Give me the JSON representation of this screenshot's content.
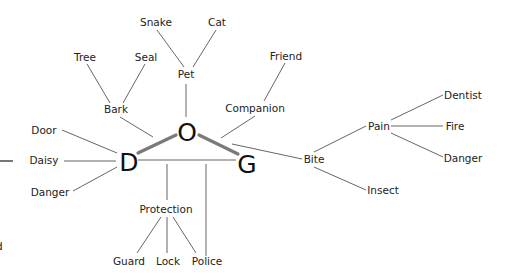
{
  "diagram": {
    "type": "word-association-map",
    "core_word": {
      "letters": [
        {
          "id": "D",
          "label": "D",
          "x": 129,
          "y": 171
        },
        {
          "id": "O",
          "label": "O",
          "x": 187,
          "y": 141
        },
        {
          "id": "G",
          "label": "G",
          "x": 247,
          "y": 173
        }
      ]
    },
    "nodes": [
      {
        "id": "snake",
        "label": "Snake",
        "x": 156,
        "y": 26
      },
      {
        "id": "cat",
        "label": "Cat",
        "x": 217,
        "y": 26
      },
      {
        "id": "pet",
        "label": "Pet",
        "x": 186,
        "y": 78
      },
      {
        "id": "tree",
        "label": "Tree",
        "x": 85,
        "y": 61
      },
      {
        "id": "seal",
        "label": "Seal",
        "x": 146,
        "y": 61
      },
      {
        "id": "bark",
        "label": "Bark",
        "x": 116,
        "y": 113
      },
      {
        "id": "friend",
        "label": "Friend",
        "x": 286,
        "y": 60
      },
      {
        "id": "companion",
        "label": "Companion",
        "x": 255,
        "y": 112
      },
      {
        "id": "door",
        "label": "Door",
        "x": 44,
        "y": 134
      },
      {
        "id": "daisy",
        "label": "Daisy",
        "x": 44,
        "y": 164
      },
      {
        "id": "danger_left",
        "label": "Danger",
        "x": 50,
        "y": 196
      },
      {
        "id": "bite",
        "label": "Bite",
        "x": 314,
        "y": 163
      },
      {
        "id": "pain",
        "label": "Pain",
        "x": 379,
        "y": 130
      },
      {
        "id": "dentist",
        "label": "Dentist",
        "x": 463,
        "y": 99
      },
      {
        "id": "fire",
        "label": "Fire",
        "x": 455,
        "y": 130
      },
      {
        "id": "danger_right",
        "label": "Danger",
        "x": 463,
        "y": 162
      },
      {
        "id": "insect",
        "label": "Insect",
        "x": 383,
        "y": 194
      },
      {
        "id": "protection",
        "label": "Protection",
        "x": 166,
        "y": 213
      },
      {
        "id": "guard",
        "label": "Guard",
        "x": 129,
        "y": 265
      },
      {
        "id": "lock",
        "label": "Lock",
        "x": 168,
        "y": 265
      },
      {
        "id": "police",
        "label": "Police",
        "x": 207,
        "y": 265
      }
    ],
    "edges": [
      {
        "from": "D",
        "to": "O",
        "style": "thick"
      },
      {
        "from": "O",
        "to": "G",
        "style": "thick"
      },
      {
        "from": "D",
        "to": "G",
        "style": "thin"
      },
      {
        "from": "O",
        "to": "pet"
      },
      {
        "from": "pet",
        "to": "snake"
      },
      {
        "from": "pet",
        "to": "cat"
      },
      {
        "from": "O",
        "to": "bark"
      },
      {
        "from": "bark",
        "to": "tree"
      },
      {
        "from": "bark",
        "to": "seal"
      },
      {
        "from": "O",
        "to": "companion"
      },
      {
        "from": "companion",
        "to": "friend"
      },
      {
        "from": "D",
        "to": "door"
      },
      {
        "from": "D",
        "to": "daisy"
      },
      {
        "from": "D",
        "to": "danger_left"
      },
      {
        "from": "O",
        "to": "bite"
      },
      {
        "from": "bite",
        "to": "pain"
      },
      {
        "from": "bite",
        "to": "insect"
      },
      {
        "from": "pain",
        "to": "dentist"
      },
      {
        "from": "pain",
        "to": "fire"
      },
      {
        "from": "pain",
        "to": "danger_right"
      },
      {
        "from": "DG-line",
        "to": "protection"
      },
      {
        "from": "DG-line",
        "to": "police"
      },
      {
        "from": "protection",
        "to": "guard"
      },
      {
        "from": "protection",
        "to": "lock"
      },
      {
        "from": "protection",
        "to": "police"
      }
    ],
    "edge_colors": {
      "thin": "#555555",
      "thick": "#7a7a7a"
    },
    "text_color": "#222222",
    "cropped_fragments": {
      "left_line": "—",
      "left_char": "d"
    }
  }
}
